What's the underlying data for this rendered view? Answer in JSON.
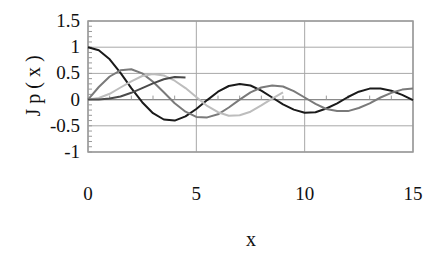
{
  "chart_data": {
    "type": "line",
    "title": "",
    "xlabel": "x",
    "ylabel": "J p ( x )",
    "xlim": [
      0,
      15
    ],
    "ylim": [
      -1,
      1.5
    ],
    "x_ticks": [
      "0",
      "5",
      "10",
      "15"
    ],
    "y_ticks": [
      "1.5",
      "1",
      "0.5",
      "0",
      "-0.5",
      "-1"
    ],
    "grid": true,
    "legend": "none",
    "series": [
      {
        "name": "J0",
        "color": "#1a1a1a",
        "x": [
          0,
          0.5,
          1,
          1.5,
          2,
          2.5,
          3,
          3.5,
          4,
          4.5,
          5,
          5.5,
          6,
          6.5,
          7,
          7.5,
          8,
          8.5,
          9,
          9.5,
          10,
          10.5,
          11,
          11.5,
          12,
          12.5,
          13,
          13.5,
          14,
          14.5,
          15
        ],
        "values": [
          1,
          0.94,
          0.77,
          0.51,
          0.22,
          -0.05,
          -0.26,
          -0.38,
          -0.4,
          -0.32,
          -0.18,
          -0.01,
          0.15,
          0.26,
          0.3,
          0.27,
          0.17,
          0.04,
          -0.09,
          -0.19,
          -0.25,
          -0.24,
          -0.17,
          -0.07,
          0.05,
          0.15,
          0.21,
          0.21,
          0.17,
          0.09,
          -0.01
        ]
      },
      {
        "name": "J1",
        "color": "#7a7a7a",
        "x": [
          0,
          0.5,
          1,
          1.5,
          2,
          2.5,
          3,
          3.5,
          4,
          4.5,
          5,
          5.5,
          6,
          6.5,
          7,
          7.5,
          8,
          8.5,
          9,
          9.5,
          10,
          10.5,
          11,
          11.5,
          12,
          12.5,
          13,
          13.5,
          14,
          14.5,
          15
        ],
        "values": [
          0,
          0.24,
          0.44,
          0.56,
          0.58,
          0.5,
          0.34,
          0.14,
          -0.07,
          -0.23,
          -0.33,
          -0.34,
          -0.28,
          -0.15,
          0.0,
          0.14,
          0.23,
          0.27,
          0.25,
          0.16,
          0.04,
          -0.08,
          -0.18,
          -0.22,
          -0.22,
          -0.16,
          -0.07,
          0.04,
          0.13,
          0.19,
          0.21
        ]
      },
      {
        "name": "J2",
        "color": "#bdbdbd",
        "x": [
          0,
          0.5,
          1,
          1.5,
          2,
          2.5,
          3,
          3.5,
          4,
          4.5,
          5,
          5.5,
          6,
          6.5,
          7,
          7.5,
          8,
          8.5,
          9
        ],
        "values": [
          0,
          0.03,
          0.11,
          0.23,
          0.35,
          0.45,
          0.49,
          0.46,
          0.36,
          0.22,
          0.05,
          -0.12,
          -0.24,
          -0.31,
          -0.3,
          -0.23,
          -0.11,
          0.02,
          0.14
        ]
      },
      {
        "name": "J3",
        "color": "#4a4a4a",
        "x": [
          0,
          0.5,
          1,
          1.5,
          2,
          2.5,
          3,
          3.5,
          4,
          4.5
        ],
        "values": [
          0,
          0.0,
          0.02,
          0.06,
          0.13,
          0.22,
          0.31,
          0.39,
          0.43,
          0.42
        ]
      }
    ]
  }
}
